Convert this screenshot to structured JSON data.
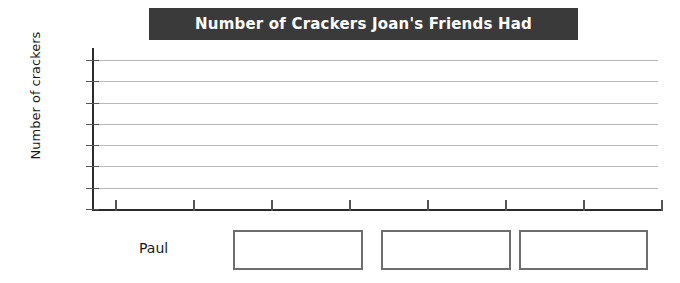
{
  "chart_data": {
    "type": "bar",
    "title": "Number of Crackers Joan's Friends Had",
    "xlabel": "",
    "ylabel": "Number of crackers",
    "categories": [],
    "values": [],
    "series": [],
    "yticks": [
      0,
      2,
      4,
      6,
      8,
      10,
      12,
      14
    ],
    "ylim": [
      0,
      14
    ],
    "ytick_labels": [
      "0",
      "2",
      "4",
      "6",
      "8",
      "10",
      "12",
      "14"
    ],
    "xtick_labels": [
      "",
      "",
      "",
      "",
      "",
      "",
      "",
      ""
    ],
    "xtick_count": 8,
    "grid": true,
    "legend": false,
    "note": "Blank bar graph template - no bars plotted"
  },
  "title": {
    "text": "Number of Crackers Joan's Friends Had",
    "banner_color": "#3a3a3a",
    "text_color": "#ffffff"
  },
  "axes": {
    "y_title": "Number of crackers",
    "y_labels": [
      "14",
      "12",
      "10",
      "8",
      "6",
      "4",
      "2",
      "0"
    ],
    "axis_color": "#2b2b2b",
    "grid_color": "#b9b9b9"
  },
  "answer_row": {
    "name_label": "Paul",
    "boxes": [
      {
        "value": "",
        "placeholder": ""
      },
      {
        "value": "",
        "placeholder": ""
      },
      {
        "value": "",
        "placeholder": ""
      }
    ],
    "border_color": "#6e6e6e"
  }
}
